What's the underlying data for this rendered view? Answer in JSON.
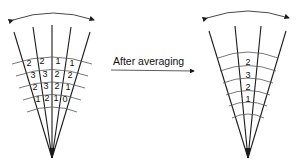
{
  "arrow_label": "After averaging",
  "before": {
    "rows": [
      [
        "2",
        "2",
        "1",
        "1"
      ],
      [
        "3",
        "3",
        "2",
        "2"
      ],
      [
        "2",
        "3",
        "2",
        "1"
      ],
      [
        "1",
        "2",
        "1",
        "0"
      ]
    ]
  },
  "after": {
    "values": [
      "2",
      "3",
      "2",
      "1"
    ]
  },
  "colors": {
    "line": "#1a1a1a",
    "arc": "#555555"
  }
}
